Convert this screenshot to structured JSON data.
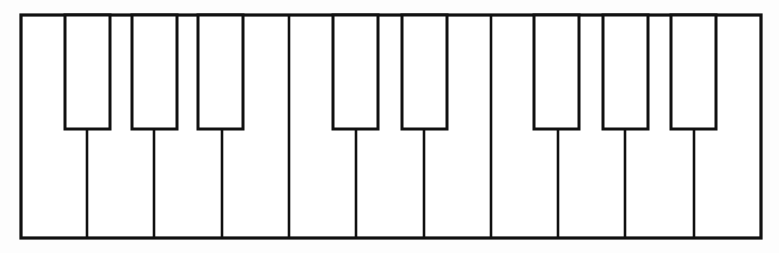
{
  "figure": {
    "style": "outline",
    "background_color": "#fdfdfd",
    "stroke_color": "#111111",
    "fill_color": "#ffffff"
  },
  "canvas": {
    "width": 779,
    "height": 253
  },
  "keyboard": {
    "x": 21,
    "y": 15,
    "width": 740,
    "height": 223,
    "border_stroke_width": 3.2,
    "white_key_count": 11,
    "black_key_count": 8,
    "black_key_groups": [
      3,
      2,
      3
    ],
    "white_key_width": 67.3,
    "black_key_width": 45,
    "black_key_height": 114,
    "divider_stroke_width": 2.6,
    "black_key_stroke_width": 3.0
  },
  "white_keys": [
    {
      "index": 1,
      "x": 21.0,
      "width": 66.0
    },
    {
      "index": 2,
      "x": 87.0,
      "width": 67.0
    },
    {
      "index": 3,
      "x": 154.0,
      "width": 68.0
    },
    {
      "index": 4,
      "x": 222.0,
      "width": 67.0
    },
    {
      "index": 5,
      "x": 289.0,
      "width": 67.0
    },
    {
      "index": 6,
      "x": 356.0,
      "width": 68.0
    },
    {
      "index": 7,
      "x": 424.0,
      "width": 67.0
    },
    {
      "index": 8,
      "x": 491.0,
      "width": 67.0
    },
    {
      "index": 9,
      "x": 558.0,
      "width": 67.0
    },
    {
      "index": 10,
      "x": 625.0,
      "width": 69.0
    },
    {
      "index": 11,
      "x": 694.0,
      "width": 67.0
    }
  ],
  "white_key_dividers": [
    {
      "index": 1,
      "x": 87.0,
      "y_top": 129,
      "y_bottom": 238
    },
    {
      "index": 2,
      "x": 154.0,
      "y_top": 129,
      "y_bottom": 238
    },
    {
      "index": 3,
      "x": 222.0,
      "y_top": 129,
      "y_bottom": 238
    },
    {
      "index": 4,
      "x": 289.0,
      "y_top": 15,
      "y_bottom": 238
    },
    {
      "index": 5,
      "x": 356.0,
      "y_top": 129,
      "y_bottom": 238
    },
    {
      "index": 6,
      "x": 424.0,
      "y_top": 129,
      "y_bottom": 238
    },
    {
      "index": 7,
      "x": 491.0,
      "y_top": 15,
      "y_bottom": 238
    },
    {
      "index": 8,
      "x": 558.0,
      "y_top": 129,
      "y_bottom": 238
    },
    {
      "index": 9,
      "x": 625.0,
      "y_top": 129,
      "y_bottom": 238
    },
    {
      "index": 10,
      "x": 694.0,
      "y_top": 129,
      "y_bottom": 238
    }
  ],
  "black_keys": [
    {
      "index": 1,
      "group": 1,
      "x": 65.0,
      "y": 15,
      "width": 45,
      "height": 114
    },
    {
      "index": 2,
      "group": 1,
      "x": 132.0,
      "y": 15,
      "width": 45,
      "height": 114
    },
    {
      "index": 3,
      "group": 1,
      "x": 198.0,
      "y": 15,
      "width": 45,
      "height": 114
    },
    {
      "index": 4,
      "group": 2,
      "x": 333.0,
      "y": 15,
      "width": 45,
      "height": 114
    },
    {
      "index": 5,
      "group": 2,
      "x": 402.0,
      "y": 15,
      "width": 45,
      "height": 114
    },
    {
      "index": 6,
      "group": 3,
      "x": 534.0,
      "y": 15,
      "width": 45,
      "height": 114
    },
    {
      "index": 7,
      "group": 3,
      "x": 603.0,
      "y": 15,
      "width": 45,
      "height": 114
    },
    {
      "index": 8,
      "group": 3,
      "x": 671.0,
      "y": 15,
      "width": 45,
      "height": 114
    }
  ]
}
